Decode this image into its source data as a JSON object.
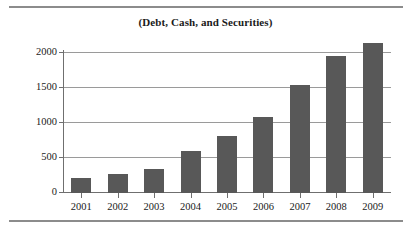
{
  "figure": {
    "title": "(Debt, Cash, and Securities)",
    "rule_color": "#8c8c8c",
    "bar_color": "#585858",
    "gridline_color": "#9a9a9a",
    "axis_color": "#6f6f6f"
  },
  "chart_data": {
    "type": "bar",
    "title": "(Debt, Cash, and Securities)",
    "xlabel": "",
    "ylabel": "",
    "categories": [
      "2001",
      "2002",
      "2003",
      "2004",
      "2005",
      "2006",
      "2007",
      "2008",
      "2009"
    ],
    "values": [
      215,
      270,
      345,
      605,
      820,
      1080,
      1540,
      1960,
      2140
    ],
    "ylim": [
      0,
      2200
    ],
    "yticks": [
      0,
      500,
      1000,
      1500,
      2000
    ],
    "ytick_labels": [
      "0",
      "500",
      "1000",
      "1500",
      "2000"
    ],
    "grid": true,
    "legend": null,
    "series": [
      {
        "name": "Debt, Cash, and Securities",
        "values": [
          215,
          270,
          345,
          605,
          820,
          1080,
          1540,
          1960,
          2140
        ]
      }
    ]
  }
}
